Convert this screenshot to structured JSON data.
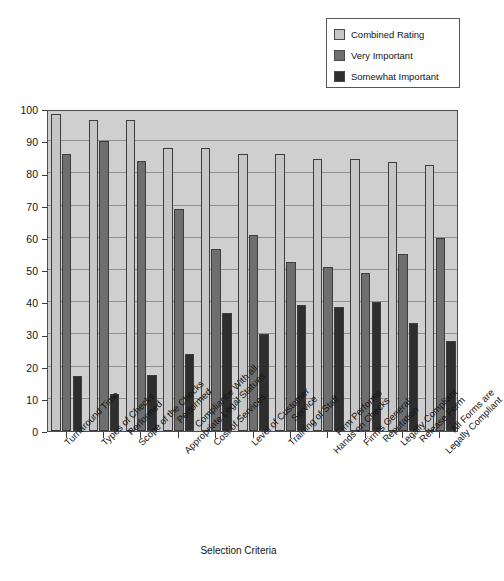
{
  "chart_data": {
    "type": "bar",
    "title": "",
    "xlabel": "Selection Criteria",
    "ylabel": "",
    "ylim": [
      0,
      100
    ],
    "yticks": [
      0,
      10,
      20,
      30,
      40,
      50,
      60,
      70,
      80,
      90,
      100
    ],
    "grid": true,
    "legend_position": "top-right",
    "categories": [
      "Turnaround Time",
      "Types of Checks Performed",
      "Scope of the Checks Performed",
      "Compliance With all Appropriate Legal Statues",
      "Cost of Services",
      "Level of Customer Service",
      "Training of Staff",
      "Firm Performs Hands on Checks",
      "Firm's General Reputation",
      "Legally Compliant Release Form",
      "All Forms are Legally Compliant"
    ],
    "category_lines": [
      [
        "Turnaround Time",
        ""
      ],
      [
        "Types of Checks",
        "Performed"
      ],
      [
        "Scope of the Checks",
        "Performed"
      ],
      [
        "Compliance With all",
        "Appropriate Legal Statues"
      ],
      [
        "Cost of Services",
        ""
      ],
      [
        "Level of Customer",
        "Service"
      ],
      [
        "Training of Staff",
        ""
      ],
      [
        "Firm Performs",
        "Hands on Checks"
      ],
      [
        "Firm's General",
        "Reputation"
      ],
      [
        "Legally Compliant",
        "Release Form"
      ],
      [
        "All Forms are",
        "Legally Compliant"
      ]
    ],
    "series": [
      {
        "name": "Combined Rating",
        "color": "#c6c6c6",
        "values": [
          98.5,
          96.5,
          96.5,
          88,
          88,
          86,
          86,
          84.5,
          84.5,
          83.5,
          82.5
        ]
      },
      {
        "name": "Very Important",
        "color": "#6e6e6e",
        "values": [
          86,
          90,
          84,
          69,
          56.5,
          61,
          52.5,
          51,
          49,
          55,
          60
        ]
      },
      {
        "name": "Somewhat Important",
        "color": "#2e2e2e",
        "values": [
          17,
          11.5,
          17.5,
          24,
          36.5,
          30,
          39,
          38.5,
          40,
          33.5,
          28
        ]
      }
    ]
  },
  "legend": {
    "items": [
      {
        "label": "Combined Rating",
        "color": "#c6c6c6"
      },
      {
        "label": "Very Important",
        "color": "#6e6e6e"
      },
      {
        "label": "Somewhat Important",
        "color": "#2e2e2e"
      }
    ]
  },
  "axis": {
    "x_title": "Selection Criteria"
  }
}
